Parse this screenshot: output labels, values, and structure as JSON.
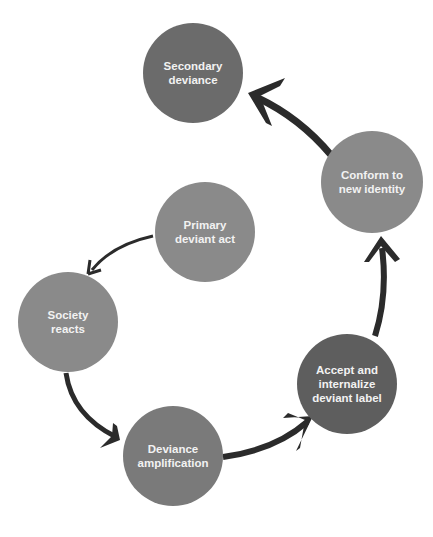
{
  "diagram": {
    "type": "cycle",
    "nodes": [
      {
        "id": "secondary",
        "label": "Secondary\ndeviance",
        "color": "#6b6b6b"
      },
      {
        "id": "conform",
        "label": "Conform to\nnew identity",
        "color": "#8a8a8a"
      },
      {
        "id": "primary",
        "label": "Primary\ndeviant act",
        "color": "#8a8a8a"
      },
      {
        "id": "society",
        "label": "Society\nreacts",
        "color": "#8a8a8a"
      },
      {
        "id": "amplification",
        "label": "Deviance\namplification",
        "color": "#7a7a7a"
      },
      {
        "id": "accept",
        "label": "Accept and\ninternalize\ndeviant label",
        "color": "#5e5e5e"
      }
    ],
    "edges": [
      {
        "from": "primary",
        "to": "society"
      },
      {
        "from": "society",
        "to": "amplification"
      },
      {
        "from": "amplification",
        "to": "accept"
      },
      {
        "from": "accept",
        "to": "conform"
      },
      {
        "from": "conform",
        "to": "secondary"
      }
    ],
    "arrow_color": "#2b2b2b"
  }
}
